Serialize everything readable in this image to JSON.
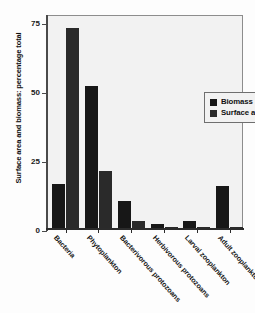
{
  "chart_data": {
    "type": "bar",
    "title": "",
    "xlabel": "",
    "ylabel": "Surface area and biomass: percentage total",
    "ylim": [
      0,
      78
    ],
    "yticks": [
      0,
      25,
      50,
      75
    ],
    "ytick_labels": [
      "0",
      "25",
      "50",
      "75"
    ],
    "grid": false,
    "legend_position": "upper-right-inside",
    "categories": [
      "Bacteria",
      "Phytoplankton",
      "Bacterivorous protozoans",
      "Herbivorous protozoans",
      "Larval zooplankton",
      "Adult zooplankton"
    ],
    "series": [
      {
        "name": "Biomass",
        "color": "#171717",
        "values": [
          16.5,
          52,
          10,
          2,
          3,
          15.5
        ]
      },
      {
        "name": "Surface area",
        "color": "#2a2a2a",
        "values": [
          73,
          21,
          3,
          0.7,
          0.7,
          0.8
        ]
      }
    ]
  },
  "legend": {
    "items": [
      {
        "label": "Biomass"
      },
      {
        "label": "Surface area"
      }
    ]
  },
  "colors": {
    "biomass": "#171717",
    "surface_area": "#2a2a2a",
    "plot_background": "#f2f2f2",
    "axis": "#2b2b2b"
  }
}
